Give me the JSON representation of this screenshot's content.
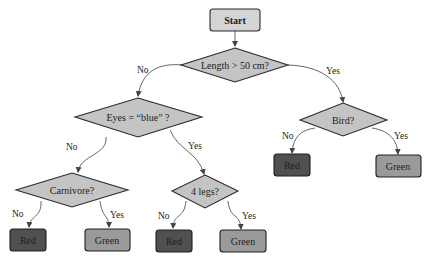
{
  "colors": {
    "start_fill": "#d4d4d4",
    "decision_fill": "#c4c4c4",
    "red_leaf_fill": "#505050",
    "green_leaf_fill": "#9a9a9a",
    "stroke": "#2a2a2a",
    "edge": "#555555"
  },
  "nodes": {
    "start": {
      "label": "Start"
    },
    "length": {
      "label": "Length > 50 cm?"
    },
    "eyes": {
      "label": "Eyes = “blue” ?"
    },
    "bird": {
      "label": "Bird?"
    },
    "carnivore": {
      "label": "Carnivore?"
    },
    "legs": {
      "label": "4 legs?"
    },
    "leaf_bird_no": {
      "label": "Red"
    },
    "leaf_bird_yes": {
      "label": "Green"
    },
    "leaf_carn_no": {
      "label": "Red"
    },
    "leaf_carn_yes": {
      "label": "Green"
    },
    "leaf_legs_no": {
      "label": "Red"
    },
    "leaf_legs_yes": {
      "label": "Green"
    }
  },
  "edges": {
    "length_no": "No",
    "length_yes": "Yes",
    "eyes_no": "No",
    "eyes_yes": "Yes",
    "bird_no": "No",
    "bird_yes": "Yes",
    "carn_no": "No",
    "carn_yes": "Yes",
    "legs_no": "No",
    "legs_yes": "Yes"
  }
}
